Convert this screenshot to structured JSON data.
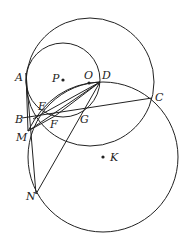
{
  "diagram": {
    "type": "geometry",
    "circles": [
      {
        "name": "circle-O",
        "cx": 90,
        "cy": 82,
        "r": 64
      },
      {
        "name": "circle-P",
        "cx": 63,
        "cy": 80,
        "r": 37
      },
      {
        "name": "circle-K",
        "cx": 103,
        "cy": 157,
        "r": 75
      }
    ],
    "arcs": [
      {
        "name": "arc-M-E-D",
        "d": "M 28 131 Q 52 84 100 82"
      }
    ],
    "segments": [
      {
        "name": "segment-B-C",
        "x1": 22,
        "y1": 118,
        "x2": 152,
        "y2": 98
      },
      {
        "name": "segment-A-N",
        "x1": 26,
        "y1": 73,
        "x2": 36,
        "y2": 194
      },
      {
        "name": "segment-M-D",
        "x1": 28,
        "y1": 131,
        "x2": 100,
        "y2": 82
      },
      {
        "name": "segment-N-D",
        "x1": 36,
        "y1": 194,
        "x2": 100,
        "y2": 82
      },
      {
        "name": "segment-B-D",
        "x1": 33,
        "y1": 119,
        "x2": 100,
        "y2": 82
      },
      {
        "name": "segment-F-D",
        "x1": 55,
        "y1": 116,
        "x2": 100,
        "y2": 82
      },
      {
        "name": "segment-M-F",
        "x1": 28,
        "y1": 131,
        "x2": 55,
        "y2": 116
      },
      {
        "name": "segment-A-M",
        "x1": 26,
        "y1": 73,
        "x2": 28,
        "y2": 131
      }
    ],
    "points": [
      {
        "name": "P",
        "x": 63,
        "y": 80,
        "label": "P",
        "lx": 52,
        "ly": 82
      },
      {
        "name": "O",
        "x": 89,
        "y": 83,
        "label": "O",
        "lx": 84,
        "ly": 79
      },
      {
        "name": "K",
        "x": 103,
        "y": 157,
        "label": "K",
        "lx": 110,
        "ly": 161
      }
    ],
    "labels": [
      {
        "text": "A",
        "x": 15,
        "y": 81
      },
      {
        "text": "P",
        "x": 52,
        "y": 82
      },
      {
        "text": "O",
        "x": 84,
        "y": 79
      },
      {
        "text": "D",
        "x": 102,
        "y": 79
      },
      {
        "text": "C",
        "x": 155,
        "y": 101
      },
      {
        "text": "E",
        "x": 38,
        "y": 110
      },
      {
        "text": "B",
        "x": 15,
        "y": 123
      },
      {
        "text": "F",
        "x": 50,
        "y": 128
      },
      {
        "text": "G",
        "x": 80,
        "y": 123
      },
      {
        "text": "M",
        "x": 16,
        "y": 141
      },
      {
        "text": "K",
        "x": 110,
        "y": 161
      },
      {
        "text": "N",
        "x": 26,
        "y": 200
      }
    ]
  }
}
